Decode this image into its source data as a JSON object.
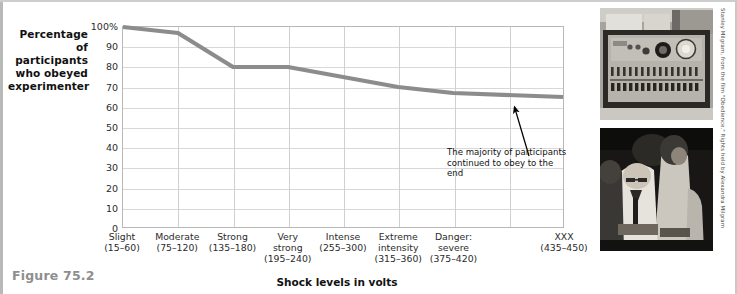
{
  "figure": {
    "number_label": "Figure 75.2",
    "credit": "Stanley Milgram, from the film \"Obedience.\" Rights held by Alexandra Milgram"
  },
  "axes": {
    "y_title_lines": [
      "Percentage",
      "of participants",
      "who obeyed",
      "experimenter"
    ],
    "y_title": "Percentage of participants who obeyed experimenter",
    "x_title": "Shock levels in volts"
  },
  "annotation": {
    "text": "The majority of participants continued to obey to the end",
    "arrow_icon": "up-right-arrow-icon"
  },
  "photos": [
    {
      "name": "shock-generator-photo",
      "caption": "Milgram shock generator apparatus"
    },
    {
      "name": "learner-strapped-photo",
      "caption": "Experimenter and learner being strapped into chair"
    }
  ],
  "colors": {
    "line": "#8c8c8c",
    "grid": "#d8d8d8",
    "plot_border": "#b7b7b7",
    "figure_number": "#8e8e8e",
    "text": "#1a1a1a"
  },
  "chart_data": {
    "type": "line",
    "title": "",
    "xlabel": "Shock levels in volts",
    "ylabel": "Percentage of participants who obeyed experimenter",
    "ylim": [
      0,
      100
    ],
    "yticks": [
      0,
      10,
      20,
      30,
      40,
      50,
      60,
      70,
      80,
      90,
      100
    ],
    "ytick_labels": [
      "0",
      "10",
      "20",
      "30",
      "40",
      "50",
      "60",
      "70",
      "80",
      "90",
      "100%"
    ],
    "grid": true,
    "legend": false,
    "categories": [
      "Slight",
      "Moderate",
      "Strong",
      "Very strong",
      "Intense",
      "Extreme intensity",
      "Danger: severe",
      "XXX"
    ],
    "category_labels": [
      {
        "name": "Slight",
        "range": "(15–60)"
      },
      {
        "name": "Moderate",
        "range": "(75–120)"
      },
      {
        "name": "Strong",
        "range": "(135–180)"
      },
      {
        "name": "Very strong",
        "range": "(195–240)"
      },
      {
        "name": "Intense",
        "range": "(255–300)"
      },
      {
        "name": "Extreme intensity",
        "range": "(315–360)"
      },
      {
        "name": "Danger: severe",
        "range": "(375–420)"
      },
      {
        "name": "XXX",
        "range": "(435–450)"
      }
    ],
    "series": [
      {
        "name": "Percentage who obeyed",
        "values": [
          100,
          97,
          80,
          80,
          75,
          70,
          67,
          65
        ]
      }
    ]
  }
}
